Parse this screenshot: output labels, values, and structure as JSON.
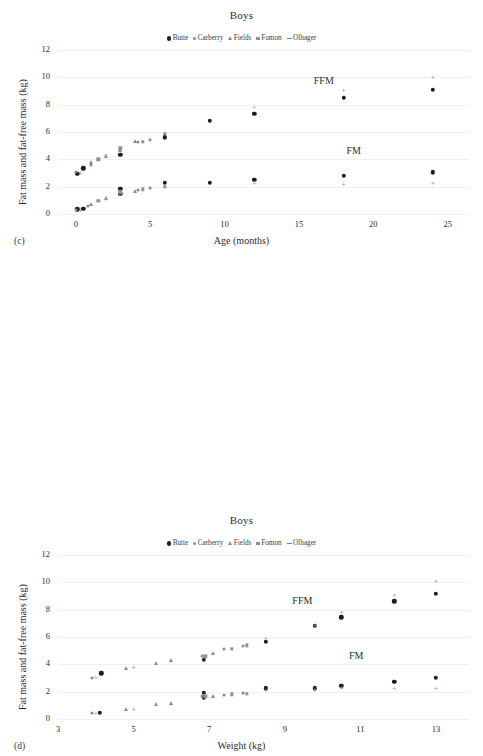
{
  "figure": {
    "background": "#ffffff",
    "series_colors": {
      "Butte": "#1d1d1d",
      "Carberry": "#8a8a8a",
      "Fields": "#8d8d8d",
      "Fomon": "#909090",
      "Olhager": "#7e7e7e"
    }
  },
  "chart_data": [
    {
      "id": "panel-c",
      "panel_letter": "(c)",
      "type": "scatter",
      "title": "Boys",
      "xlabel": "Age (months)",
      "ylabel": "Fat mass and fat-free mass (kg)",
      "xlim": [
        -1.2,
        26.5
      ],
      "ylim": [
        0,
        12
      ],
      "xticks": [
        0,
        5,
        10,
        15,
        20,
        25
      ],
      "yticks": [
        0,
        2,
        4,
        6,
        8,
        10,
        12
      ],
      "grid": false,
      "legend_position": "top-center",
      "annotations": [
        {
          "text": "FFM",
          "x": 16.0,
          "y": 9.7
        },
        {
          "text": "FM",
          "x": 18.2,
          "y": 4.6
        }
      ],
      "series": [
        {
          "name": "Butte",
          "marker": "filled-circle",
          "points_ffm": [
            [
              0.1,
              2.95
            ],
            [
              0.5,
              3.35
            ],
            [
              3.0,
              4.35
            ],
            [
              6.0,
              5.6
            ],
            [
              9.0,
              6.8
            ],
            [
              12.0,
              7.35
            ],
            [
              18.0,
              8.5
            ],
            [
              24.0,
              9.1
            ]
          ],
          "points_fm": [
            [
              0.1,
              0.35
            ],
            [
              0.5,
              0.4
            ],
            [
              3.0,
              1.85
            ],
            [
              3.0,
              1.5
            ],
            [
              6.0,
              2.3
            ],
            [
              9.0,
              2.3
            ],
            [
              12.0,
              2.5
            ],
            [
              18.0,
              2.8
            ],
            [
              24.0,
              3.05
            ]
          ]
        },
        {
          "name": "Carberry",
          "marker": "small-circle",
          "points_ffm": [
            [
              0.0,
              3.05
            ],
            [
              1.0,
              3.6
            ],
            [
              4.2,
              5.25
            ],
            [
              5.0,
              5.4
            ]
          ],
          "points_fm": [
            [
              0.0,
              0.3
            ],
            [
              0.8,
              0.6
            ],
            [
              4.2,
              1.75
            ],
            [
              5.0,
              1.9
            ]
          ]
        },
        {
          "name": "Fields",
          "marker": "triangle",
          "points_ffm": [
            [
              1.0,
              3.8
            ],
            [
              2.0,
              4.25
            ],
            [
              3.0,
              4.65
            ],
            [
              4.0,
              5.35
            ]
          ],
          "points_fm": [
            [
              1.0,
              0.7
            ],
            [
              2.0,
              1.15
            ],
            [
              3.0,
              1.7
            ],
            [
              4.0,
              1.7
            ]
          ]
        },
        {
          "name": "Fomon",
          "marker": "square",
          "points_ffm": [
            [
              1.5,
              4.0
            ],
            [
              3.0,
              4.8
            ],
            [
              4.5,
              5.3
            ],
            [
              6.0,
              5.85
            ]
          ],
          "points_fm": [
            [
              1.5,
              0.95
            ],
            [
              3.0,
              1.6
            ],
            [
              4.5,
              1.8
            ],
            [
              6.0,
              2.0
            ]
          ]
        },
        {
          "name": "Olhager",
          "marker": "dash",
          "points_ffm": [
            [
              0.3,
              3.0
            ],
            [
              2.0,
              4.3
            ],
            [
              5.0,
              5.5
            ],
            [
              6.0,
              5.95
            ],
            [
              12.0,
              7.85
            ],
            [
              18.0,
              9.05
            ],
            [
              24.0,
              10.05
            ]
          ],
          "points_fm": [
            [
              0.3,
              0.3
            ],
            [
              2.0,
              1.1
            ],
            [
              5.0,
              1.9
            ],
            [
              6.0,
              1.95
            ],
            [
              12.0,
              2.3
            ],
            [
              18.0,
              2.2
            ],
            [
              24.0,
              2.3
            ]
          ]
        }
      ]
    },
    {
      "id": "panel-d",
      "panel_letter": "(d)",
      "type": "scatter",
      "title": "Boys",
      "xlabel": "Weight (kg)",
      "ylabel": "Fat mass and fat-free mass (kg)",
      "xlim": [
        3,
        13.9
      ],
      "ylim": [
        0,
        12
      ],
      "xticks": [
        3,
        5,
        7,
        9,
        11,
        13
      ],
      "yticks": [
        0,
        2,
        4,
        6,
        8,
        10,
        12
      ],
      "grid": false,
      "legend_position": "top-center",
      "annotations": [
        {
          "text": "FFM",
          "x": 9.2,
          "y": 8.6
        },
        {
          "text": "FM",
          "x": 10.7,
          "y": 4.6
        }
      ],
      "series": [
        {
          "name": "Butte",
          "marker": "filled-circle",
          "points_ffm": [
            [
              4.15,
              3.35
            ],
            [
              6.85,
              4.35
            ],
            [
              8.5,
              5.65
            ],
            [
              9.8,
              6.8
            ],
            [
              10.5,
              7.45
            ],
            [
              11.9,
              8.6
            ],
            [
              13.0,
              9.15
            ]
          ],
          "points_fm": [
            [
              4.1,
              0.45
            ],
            [
              6.85,
              1.9
            ],
            [
              6.85,
              1.6
            ],
            [
              8.5,
              2.25
            ],
            [
              9.8,
              2.25
            ],
            [
              10.5,
              2.45
            ],
            [
              11.9,
              2.7
            ],
            [
              13.0,
              3.0
            ]
          ]
        },
        {
          "name": "Carberry",
          "marker": "small-circle",
          "points_ffm": [
            [
              3.9,
              3.0
            ],
            [
              6.8,
              4.6
            ],
            [
              7.4,
              5.1
            ],
            [
              7.9,
              5.35
            ]
          ],
          "points_fm": [
            [
              3.9,
              0.45
            ],
            [
              6.8,
              1.7
            ],
            [
              7.4,
              1.75
            ],
            [
              7.9,
              1.9
            ]
          ]
        },
        {
          "name": "Fields",
          "marker": "triangle",
          "points_ffm": [
            [
              4.8,
              3.75
            ],
            [
              5.6,
              4.1
            ],
            [
              6.0,
              4.3
            ],
            [
              7.1,
              4.85
            ]
          ],
          "points_fm": [
            [
              4.8,
              0.7
            ],
            [
              5.6,
              1.1
            ],
            [
              6.0,
              1.2
            ],
            [
              7.1,
              1.65
            ]
          ]
        },
        {
          "name": "Fomon",
          "marker": "square",
          "points_ffm": [
            [
              6.9,
              4.6
            ],
            [
              7.6,
              5.15
            ],
            [
              8.0,
              5.4
            ]
          ],
          "points_fm": [
            [
              6.9,
              1.65
            ],
            [
              7.6,
              1.8
            ],
            [
              8.0,
              1.85
            ]
          ]
        },
        {
          "name": "Olhager",
          "marker": "dash",
          "points_ffm": [
            [
              4.0,
              3.1
            ],
            [
              5.0,
              3.8
            ],
            [
              8.5,
              5.9
            ],
            [
              9.8,
              6.85
            ],
            [
              10.5,
              7.85
            ],
            [
              11.9,
              9.1
            ],
            [
              13.0,
              10.1
            ]
          ],
          "points_fm": [
            [
              4.0,
              0.45
            ],
            [
              5.0,
              0.7
            ],
            [
              8.5,
              2.15
            ],
            [
              9.8,
              2.2
            ],
            [
              10.5,
              2.25
            ],
            [
              11.9,
              2.25
            ],
            [
              13.0,
              2.3
            ]
          ]
        }
      ]
    }
  ],
  "legend": {
    "items": [
      {
        "label": "Butte",
        "marker": "filled-circle"
      },
      {
        "label": "Carberry",
        "marker": "small-circle"
      },
      {
        "label": "Fields",
        "marker": "triangle"
      },
      {
        "label": "Fomon",
        "marker": "square"
      },
      {
        "label": "Olhager",
        "marker": "dash"
      }
    ]
  }
}
